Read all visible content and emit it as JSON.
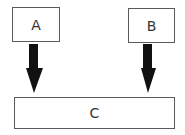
{
  "diagram": {
    "nodes": [
      {
        "id": "A",
        "label": "A"
      },
      {
        "id": "B",
        "label": "B"
      },
      {
        "id": "C",
        "label": "C"
      }
    ],
    "edges": [
      {
        "from": "A",
        "to": "C",
        "style": "thick-arrow"
      },
      {
        "from": "B",
        "to": "C",
        "style": "thick-arrow"
      }
    ],
    "colors": {
      "border": "#5a5a5a",
      "arrow": "#111111",
      "text": "#333333",
      "background": "#ffffff"
    }
  }
}
